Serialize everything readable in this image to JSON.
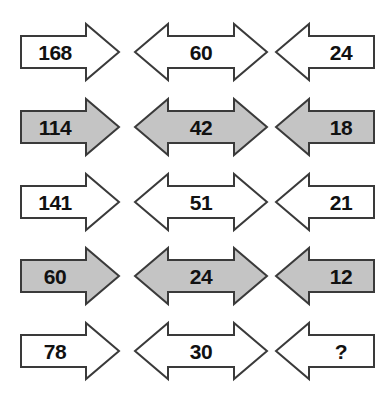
{
  "diagram": {
    "background_color": "#ffffff",
    "colors": {
      "white_fill": "#ffffff",
      "gray_fill": "#c4c4c4",
      "outline": "#3a3a3a",
      "text": "#111111"
    },
    "rows": [
      {
        "row_index": 1,
        "fill": "white",
        "cells": [
          {
            "value": "168",
            "direction": "right"
          },
          {
            "value": "60",
            "direction": "both"
          },
          {
            "value": "24",
            "direction": "left"
          }
        ]
      },
      {
        "row_index": 2,
        "fill": "gray",
        "cells": [
          {
            "value": "114",
            "direction": "right"
          },
          {
            "value": "42",
            "direction": "both"
          },
          {
            "value": "18",
            "direction": "left"
          }
        ]
      },
      {
        "row_index": 3,
        "fill": "white",
        "cells": [
          {
            "value": "141",
            "direction": "right"
          },
          {
            "value": "51",
            "direction": "both"
          },
          {
            "value": "21",
            "direction": "left"
          }
        ]
      },
      {
        "row_index": 4,
        "fill": "gray",
        "cells": [
          {
            "value": "60",
            "direction": "right"
          },
          {
            "value": "24",
            "direction": "both"
          },
          {
            "value": "12",
            "direction": "left"
          }
        ]
      },
      {
        "row_index": 5,
        "fill": "white",
        "cells": [
          {
            "value": "78",
            "direction": "right"
          },
          {
            "value": "30",
            "direction": "both"
          },
          {
            "value": "?",
            "direction": "left"
          }
        ]
      }
    ]
  }
}
